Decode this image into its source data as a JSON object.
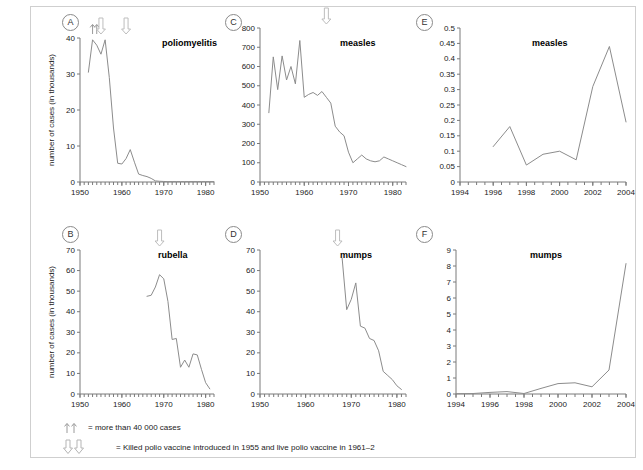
{
  "figure": {
    "y_axis_label": "number of cases (in thousands)",
    "legend": [
      {
        "glyph": "up-up-arrows",
        "text": "= more than 40 000 cases"
      },
      {
        "glyph": "down-down-arrows",
        "text": "= Killed polio vaccine introduced in 1955 and live polio vaccine in 1961–2"
      }
    ]
  },
  "chart_data": [
    {
      "panel": "A",
      "type": "line",
      "title": "poliomyelitis",
      "xlabel": "",
      "ylabel": "number of cases (in thousands)",
      "xlim": [
        1950,
        1982
      ],
      "ylim": [
        0,
        40
      ],
      "xticks": [
        1950,
        1960,
        1970,
        1980
      ],
      "yticks": [
        0,
        10,
        20,
        30,
        40
      ],
      "grid": false,
      "annotations": [
        {
          "type": "up-arrow",
          "x": 1953,
          "note": "more than 40 000 cases"
        },
        {
          "type": "up-arrow",
          "x": 1954,
          "note": "more than 40 000 cases"
        },
        {
          "type": "down-arrow",
          "x": 1955,
          "note": "Killed polio vaccine introduced"
        },
        {
          "type": "down-arrow",
          "x": 1961,
          "note": "Live polio vaccine introduced"
        }
      ],
      "x": [
        1952,
        1953,
        1954,
        1955,
        1956,
        1957,
        1958,
        1959,
        1960,
        1961,
        1962,
        1963,
        1964,
        1965,
        1966,
        1967,
        1968,
        1969,
        1970,
        1971,
        1972,
        1973,
        1974,
        1975,
        1976,
        1977,
        1978,
        1979,
        1980,
        1981,
        1982
      ],
      "values": [
        30.5,
        39.5,
        38.0,
        35.5,
        39.5,
        29.0,
        15.0,
        5.2,
        5.0,
        6.5,
        9.0,
        5.5,
        2.2,
        1.8,
        1.5,
        1.0,
        0.3,
        0.2,
        0.15,
        0.1,
        0.1,
        0.1,
        0.1,
        0.1,
        0.1,
        0.1,
        0.1,
        0.1,
        0.1,
        0.1,
        0.1
      ]
    },
    {
      "panel": "B",
      "type": "line",
      "title": "rubella",
      "xlabel": "",
      "ylabel": "number of cases (in thousands)",
      "xlim": [
        1950,
        1982
      ],
      "ylim": [
        0,
        70
      ],
      "xticks": [
        1950,
        1960,
        1970,
        1980
      ],
      "yticks": [
        0,
        10,
        20,
        30,
        40,
        50,
        60,
        70
      ],
      "grid": false,
      "annotations": [
        {
          "type": "down-arrow",
          "x": 1969,
          "note": "vaccine introduced"
        }
      ],
      "x": [
        1966,
        1967,
        1968,
        1969,
        1970,
        1971,
        1972,
        1973,
        1974,
        1975,
        1976,
        1977,
        1978,
        1979,
        1980,
        1981
      ],
      "values": [
        47.5,
        48.0,
        52.0,
        58.0,
        56.0,
        45.0,
        26.5,
        27.0,
        13.0,
        16.5,
        13.0,
        19.5,
        19.0,
        12.0,
        5.5,
        2.5
      ]
    },
    {
      "panel": "C",
      "type": "line",
      "title": "measles",
      "xlabel": "",
      "ylabel": "",
      "xlim": [
        1950,
        1983
      ],
      "ylim": [
        0,
        800
      ],
      "xticks": [
        1950,
        1960,
        1970,
        1980
      ],
      "yticks": [
        0,
        100,
        200,
        300,
        400,
        500,
        600,
        700,
        800
      ],
      "grid": false,
      "annotations": [
        {
          "type": "down-arrow",
          "x": 1965,
          "note": "vaccine introduced"
        }
      ],
      "x": [
        1952,
        1953,
        1954,
        1955,
        1956,
        1957,
        1958,
        1959,
        1960,
        1961,
        1962,
        1963,
        1964,
        1965,
        1966,
        1967,
        1968,
        1969,
        1970,
        1971,
        1972,
        1973,
        1974,
        1975,
        1976,
        1977,
        1978,
        1979,
        1980,
        1981,
        1982,
        1983
      ],
      "values": [
        360,
        650,
        480,
        655,
        530,
        600,
        510,
        735,
        440,
        455,
        465,
        450,
        470,
        440,
        410,
        290,
        260,
        240,
        155,
        100,
        120,
        140,
        120,
        110,
        105,
        110,
        130,
        120,
        110,
        100,
        90,
        80
      ]
    },
    {
      "panel": "D",
      "type": "line",
      "title": "mumps",
      "xlabel": "",
      "ylabel": "",
      "xlim": [
        1950,
        1982
      ],
      "ylim": [
        0,
        70
      ],
      "xticks": [
        1950,
        1960,
        1970,
        1980
      ],
      "yticks": [
        0,
        10,
        20,
        30,
        40,
        50,
        60,
        70
      ],
      "grid": false,
      "annotations": [
        {
          "type": "down-arrow",
          "x": 1967,
          "note": "vaccine introduced"
        }
      ],
      "x": [
        1968,
        1969,
        1970,
        1971,
        1972,
        1973,
        1974,
        1975,
        1976,
        1977,
        1978,
        1979,
        1980,
        1981
      ],
      "values": [
        66,
        41,
        46,
        54,
        33,
        32,
        27,
        26,
        21,
        11,
        9,
        7,
        4,
        2.2
      ]
    },
    {
      "panel": "E",
      "type": "line",
      "title": "measles",
      "xlabel": "",
      "ylabel": "",
      "xlim": [
        1994,
        2004
      ],
      "ylim": [
        0,
        0.5
      ],
      "xticks": [
        1994,
        1996,
        1998,
        2000,
        2002,
        2004
      ],
      "yticks": [
        0,
        0.05,
        0.1,
        0.15,
        0.2,
        0.25,
        0.3,
        0.35,
        0.4,
        0.45,
        0.5
      ],
      "grid": false,
      "annotations": [],
      "x": [
        1996,
        1997,
        1998,
        1999,
        2000,
        2001,
        2002,
        2003,
        2004
      ],
      "values": [
        0.115,
        0.18,
        0.055,
        0.09,
        0.1,
        0.072,
        0.31,
        0.44,
        0.195
      ]
    },
    {
      "panel": "F",
      "type": "line",
      "title": "mumps",
      "xlabel": "",
      "ylabel": "",
      "xlim": [
        1994,
        2004
      ],
      "ylim": [
        0,
        9
      ],
      "xticks": [
        1994,
        1996,
        1998,
        2000,
        2002,
        2004
      ],
      "yticks": [
        0,
        1,
        2,
        3,
        4,
        5,
        6,
        7,
        8,
        9
      ],
      "grid": false,
      "annotations": [],
      "x": [
        1994,
        1995,
        1996,
        1997,
        1998,
        1999,
        2000,
        2001,
        2002,
        2003,
        2004
      ],
      "values": [
        0.02,
        0.03,
        0.1,
        0.15,
        0.03,
        0.35,
        0.65,
        0.7,
        0.45,
        1.5,
        8.15
      ]
    }
  ]
}
